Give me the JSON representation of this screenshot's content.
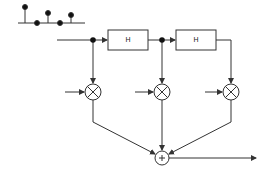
{
  "diagram": {
    "type": "FIR filter block diagram (tapped delay line)",
    "stem_plot": {
      "baseline_y": 23,
      "x_start": 18,
      "x_end": 85,
      "samples": [
        {
          "x": 25,
          "y": 7
        },
        {
          "x": 37,
          "y": 23
        },
        {
          "x": 48,
          "y": 13
        },
        {
          "x": 60,
          "y": 23
        },
        {
          "x": 71,
          "y": 15
        }
      ]
    },
    "blocks": [
      {
        "label": "H",
        "x": 108,
        "y": 30,
        "w": 40,
        "h": 20
      },
      {
        "label": "H",
        "x": 176,
        "y": 30,
        "w": 40,
        "h": 20
      }
    ],
    "multipliers": [
      {
        "symbol": "⊗",
        "cx": 93,
        "cy": 92
      },
      {
        "symbol": "⊗",
        "cx": 162,
        "cy": 92
      },
      {
        "symbol": "⊗",
        "cx": 231,
        "cy": 92
      }
    ],
    "adder": {
      "symbol": "+",
      "cx": 162,
      "cy": 158
    },
    "colors": {
      "line": "#333333",
      "fill": "#ffffff"
    }
  }
}
